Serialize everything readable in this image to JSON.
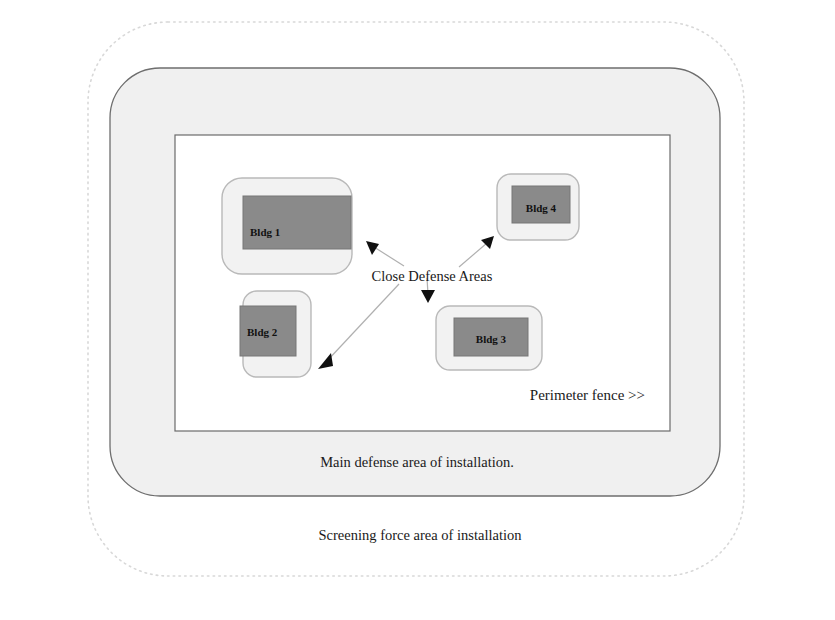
{
  "diagram": {
    "colors": {
      "outer_dotted_stroke": "#d8d8d8",
      "screening_fill": "#ffffff",
      "main_area_fill": "#f0f0f0",
      "main_area_stroke": "#6e6e6e",
      "perimeter_fill": "#ffffff",
      "perimeter_stroke": "#6b6b6b",
      "close_area_fill": "#f2f2f2",
      "close_area_stroke": "#b9b9b9",
      "building_fill": "#8a8a8a",
      "building_stroke": "#767676",
      "arrow_stroke": "#b0b0b0",
      "arrow_head": "#101010",
      "text": "#1a1a1a"
    },
    "regions": {
      "screening_force_area": {
        "name": "Screening force area of installation",
        "caption": "Screening force area of installation",
        "boundary_style": "dotted"
      },
      "main_defense_area": {
        "name": "Main defense area of installation",
        "caption": "Main defense area of installation.",
        "boundary_style": "solid-rounded"
      },
      "perimeter_fence": {
        "name": "Perimeter fence",
        "caption": "Perimeter fence >>",
        "boundary_style": "solid-rectangle"
      }
    },
    "center_label": "Close Defense Areas",
    "close_defense_areas": [
      {
        "id": "bldg1",
        "label": "Bldg 1",
        "area_x": 222,
        "area_y": 178,
        "area_w": 130,
        "area_h": 96,
        "area_r": 20,
        "bldg_x": 243,
        "bldg_y": 196,
        "bldg_w": 108,
        "bldg_h": 53,
        "label_x": 250,
        "label_y": 236,
        "label_anchor": "start"
      },
      {
        "id": "bldg2",
        "label": "Bldg 2",
        "area_x": 243,
        "area_y": 291,
        "area_w": 68,
        "area_h": 86,
        "area_r": 14,
        "bldg_x": 240,
        "bldg_y": 306,
        "bldg_w": 56,
        "bldg_h": 50,
        "label_x": 247,
        "label_y": 336,
        "label_anchor": "start"
      },
      {
        "id": "bldg3",
        "label": "Bldg 3",
        "area_x": 436,
        "area_y": 306,
        "area_w": 106,
        "area_h": 64,
        "area_r": 14,
        "bldg_x": 454,
        "bldg_y": 318,
        "bldg_w": 74,
        "bldg_h": 38,
        "label_x": 491,
        "label_y": 343,
        "label_anchor": "middle"
      },
      {
        "id": "bldg4",
        "label": "Bldg 4",
        "area_x": 497,
        "area_y": 174,
        "area_w": 82,
        "area_h": 66,
        "area_r": 14,
        "bldg_x": 512,
        "bldg_y": 186,
        "bldg_w": 58,
        "bldg_h": 37,
        "label_x": 541,
        "label_y": 212,
        "label_anchor": "middle"
      }
    ],
    "arrows": [
      {
        "id": "arrow-to-bldg1",
        "target": "Bldg 1",
        "x1": 404,
        "y1": 264,
        "x2": 369,
        "y2": 243,
        "dir": "up-left"
      },
      {
        "id": "arrow-to-bldg4",
        "target": "Bldg 4",
        "x1": 458,
        "y1": 265,
        "x2": 491,
        "y2": 239,
        "dir": "up-right"
      },
      {
        "id": "arrow-to-bldg3",
        "target": "Bldg 3",
        "x1": 428,
        "y1": 280,
        "x2": 427,
        "y2": 300,
        "dir": "down"
      },
      {
        "id": "arrow-to-bldg2",
        "target": "Bldg 2",
        "x1": 398,
        "y1": 283,
        "x2": 320,
        "y2": 366,
        "dir": "down-left"
      }
    ],
    "captions": {
      "center": {
        "text": "Close Defense Areas",
        "x": 432,
        "y": 281
      },
      "main": {
        "text": "Main defense area of installation.",
        "x": 417,
        "y": 467
      },
      "screening": {
        "text": "Screening force area of installation",
        "x": 420,
        "y": 540
      },
      "fence": {
        "text": "Perimeter fence >>",
        "x": 645,
        "y": 400
      }
    }
  }
}
